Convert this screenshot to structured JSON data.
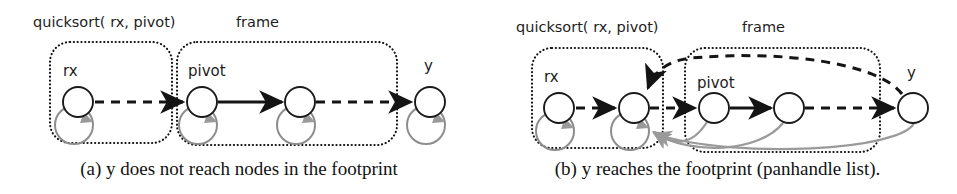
{
  "figure": {
    "panels": [
      {
        "id": "a",
        "caption": "(a) y does not reach nodes in the footprint",
        "labels": {
          "call": "quicksort( rx, pivot)",
          "frame": "frame",
          "rx_box": "rx",
          "pivot_box": "pivot",
          "y_node": "y"
        },
        "nodes": [
          {
            "name": "rx-node",
            "cx": 78,
            "cy": 102,
            "r": 15,
            "self_loop": true,
            "region": "rx-box"
          },
          {
            "name": "pivot-node",
            "cx": 202,
            "cy": 102,
            "r": 15,
            "self_loop": true,
            "region": "frame-box"
          },
          {
            "name": "frame-node-2",
            "cx": 300,
            "cy": 102,
            "r": 15,
            "self_loop": true,
            "region": "frame-box"
          },
          {
            "name": "y-node",
            "cx": 430,
            "cy": 102,
            "r": 15,
            "self_loop": true,
            "region": "outside"
          }
        ],
        "edges": [
          {
            "name": "rx-to-pivot",
            "style": "dashed",
            "from": "rx-node",
            "to": "pivot-node"
          },
          {
            "name": "pivot-to-next",
            "style": "solid",
            "from": "pivot-node",
            "to": "frame-node-2"
          },
          {
            "name": "next-to-y",
            "style": "dashed",
            "from": "frame-node-2",
            "to": "y-node"
          }
        ],
        "boxes": [
          {
            "name": "rx-box",
            "x": 50,
            "y": 42,
            "w": 122,
            "h": 101
          },
          {
            "name": "frame-box",
            "x": 177,
            "y": 42,
            "w": 220,
            "h": 103
          }
        ]
      },
      {
        "id": "b",
        "caption": "(b) y reaches the footprint (panhandle list).",
        "labels": {
          "call": "quicksort( rx, pivot)",
          "frame": "frame",
          "rx_box": "rx",
          "pivot_box": "pivot",
          "y_node": "y"
        },
        "nodes": [
          {
            "name": "rx-node",
            "cx": 81,
            "cy": 108,
            "r": 15,
            "self_loop": true,
            "region": "rx-box"
          },
          {
            "name": "rx-node-2",
            "cx": 156,
            "cy": 108,
            "r": 15,
            "self_loop": true,
            "region": "rx-box"
          },
          {
            "name": "pivot-node",
            "cx": 236,
            "cy": 108,
            "r": 15,
            "self_loop": false,
            "region": "frame-box"
          },
          {
            "name": "frame-node-2",
            "cx": 311,
            "cy": 108,
            "r": 15,
            "self_loop": false,
            "region": "frame-box"
          },
          {
            "name": "y-node",
            "cx": 435,
            "cy": 108,
            "r": 15,
            "self_loop": false,
            "region": "outside"
          }
        ],
        "edges": [
          {
            "name": "rx-to-rx2",
            "style": "dashed",
            "from": "rx-node",
            "to": "rx-node-2"
          },
          {
            "name": "rx2-to-pivot",
            "style": "dashed",
            "from": "rx-node-2",
            "to": "pivot-node"
          },
          {
            "name": "pivot-to-next",
            "style": "solid",
            "from": "pivot-node",
            "to": "frame-node-2"
          },
          {
            "name": "next-to-y",
            "style": "dashed",
            "from": "frame-node-2",
            "to": "y-node"
          },
          {
            "name": "y-back-to-rx2",
            "style": "dashed-arc-over",
            "from": "y-node",
            "to": "rx-node-2"
          },
          {
            "name": "pivot-gray-to-rx2",
            "style": "gray-arc-under",
            "from": "pivot-node",
            "to": "rx-node-2"
          },
          {
            "name": "next-gray-to-rx2",
            "style": "gray-arc-under",
            "from": "frame-node-2",
            "to": "rx-node-2"
          },
          {
            "name": "y-gray-to-rx2",
            "style": "gray-arc-under",
            "from": "y-node",
            "to": "rx-node-2"
          }
        ],
        "boxes": [
          {
            "name": "rx-box",
            "x": 54,
            "y": 48,
            "w": 131,
            "h": 100
          },
          {
            "name": "frame-box",
            "x": 207,
            "y": 48,
            "w": 195,
            "h": 104
          }
        ]
      }
    ]
  }
}
